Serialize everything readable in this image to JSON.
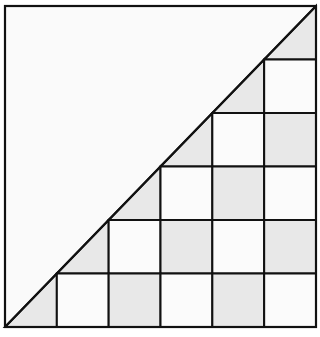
{
  "diagram": {
    "grid_size": 6,
    "colors": {
      "background": "#fafafa",
      "white_cell": "#fbfbfb",
      "shaded_cell": "#e8e8e8",
      "line": "#111111"
    },
    "rows": [
      [
        "empty",
        "empty",
        "empty",
        "empty",
        "empty",
        "tri"
      ],
      [
        "empty",
        "empty",
        "empty",
        "empty",
        "tri",
        "white"
      ],
      [
        "empty",
        "empty",
        "empty",
        "tri",
        "white",
        "gray"
      ],
      [
        "empty",
        "empty",
        "tri",
        "white",
        "gray",
        "white"
      ],
      [
        "empty",
        "tri",
        "white",
        "gray",
        "white",
        "gray"
      ],
      [
        "tri",
        "white",
        "gray",
        "white",
        "gray",
        "white"
      ]
    ]
  }
}
